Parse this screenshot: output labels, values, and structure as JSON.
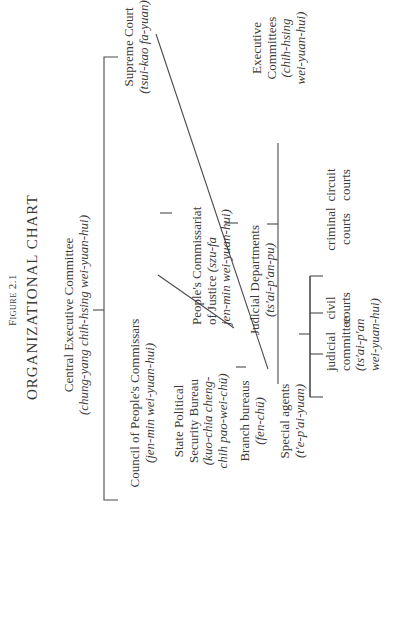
{
  "figure": {
    "label": "Figure 2.1",
    "title": "ORGANIZATIONAL CHART"
  },
  "nodes": {
    "cec": {
      "name": "Central Executive Committee",
      "romanized": "(chung-yang chih-hsing wei-yuan-hui)"
    },
    "council": {
      "name": "Council of People's Commissars",
      "romanized": "(jen-min wei-yuan-hui)"
    },
    "supreme_court": {
      "name": "Supreme Court",
      "romanized": "(tsui-kao fa-yuan)"
    },
    "spsb": {
      "line1": "State Political",
      "line2": "Security Bureau",
      "line3": "(kuo-chia cheng-",
      "line4": "chih pao-wei-chü)"
    },
    "branch": {
      "name": "Branch bureaus",
      "romanized": "(fen-chü)"
    },
    "agents": {
      "name": "Special agents",
      "romanized": "(t'e-p'ai-yuan)"
    },
    "justice": {
      "line1": "People's Commissariat",
      "line2": "of Justice",
      "line2_it": "(szu-fa",
      "line3": "jen-min wei-yuan-hui)"
    },
    "judicial_dept": {
      "name": "Judicial Departments",
      "romanized": "(ts'ai-p'an-pu)"
    },
    "exec_committees": {
      "line1": "Executive",
      "line2": "Committees",
      "line3": "(chih-hsing",
      "line4": "wei-yuan-hui)"
    },
    "judicial_committee": {
      "line1": "judicial",
      "line2": "committee",
      "line3": "(ts'ai-p'an",
      "line4": "wei-yuan-hui)"
    },
    "civil": {
      "line1": "civil",
      "line2": "courts"
    },
    "criminal": {
      "line1": "criminal",
      "line2": "courts"
    },
    "circuit": {
      "line1": "circuit",
      "line2": "courts"
    }
  }
}
